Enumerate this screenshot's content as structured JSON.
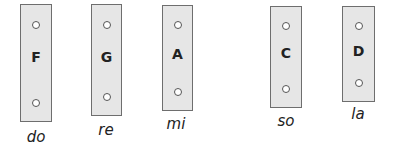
{
  "bars": [
    {
      "note": "F",
      "syllable": "do"
    },
    {
      "note": "G",
      "syllable": "re"
    },
    {
      "note": "A",
      "syllable": "mi"
    },
    {
      "note": "C",
      "syllable": "so"
    },
    {
      "note": "D",
      "syllable": "la"
    }
  ]
}
